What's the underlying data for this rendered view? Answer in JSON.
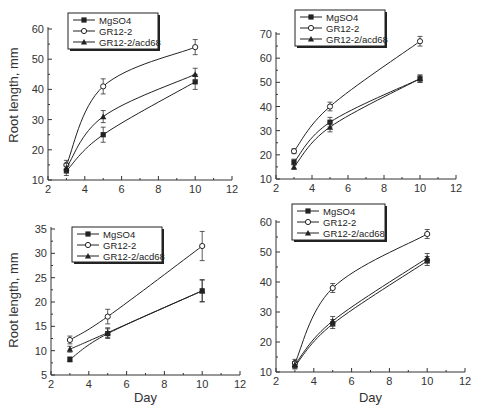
{
  "chart_data": [
    {
      "type": "line",
      "panel": "top-left",
      "title": "",
      "xlabel": "",
      "ylabel": "Root length, mm",
      "xlim": [
        2,
        12
      ],
      "ylim": [
        10,
        60
      ],
      "xticks": [
        2,
        4,
        6,
        8,
        10,
        12
      ],
      "yticks": [
        10,
        20,
        30,
        40,
        50,
        60
      ],
      "legend_position": "top-left inside",
      "grid": false,
      "x": [
        3,
        5,
        10
      ],
      "series": [
        {
          "name": "MgSO4",
          "marker": "filled-square",
          "values": [
            13,
            25,
            42.5
          ],
          "errors": [
            1.5,
            2.5,
            2.5
          ]
        },
        {
          "name": "GR12-2",
          "marker": "open-circle",
          "values": [
            15,
            41,
            54
          ],
          "errors": [
            1.5,
            2.5,
            2.5
          ]
        },
        {
          "name": "GR12-2/acd68",
          "marker": "filled-triangle",
          "values": [
            14,
            31,
            45
          ],
          "errors": [
            1.5,
            2,
            2
          ]
        }
      ]
    },
    {
      "type": "line",
      "panel": "top-right",
      "title": "",
      "xlabel": "",
      "ylabel": "",
      "xlim": [
        2,
        12
      ],
      "ylim": [
        10,
        70
      ],
      "xticks": [
        2,
        4,
        6,
        8,
        10,
        12
      ],
      "yticks": [
        10,
        20,
        30,
        40,
        50,
        60,
        70
      ],
      "legend_position": "top inside",
      "grid": false,
      "x": [
        3,
        5,
        10
      ],
      "series": [
        {
          "name": "MgSO4",
          "marker": "filled-square",
          "values": [
            17,
            33.5,
            51.5
          ],
          "errors": [
            1.2,
            2,
            1.5
          ]
        },
        {
          "name": "GR12-2",
          "marker": "open-circle",
          "values": [
            21.5,
            40,
            67
          ],
          "errors": [
            1,
            1.8,
            2
          ]
        },
        {
          "name": "GR12-2/acd68",
          "marker": "filled-triangle",
          "values": [
            15,
            31.5,
            51.5
          ],
          "errors": [
            1,
            2,
            1.5
          ]
        }
      ]
    },
    {
      "type": "line",
      "panel": "bottom-left",
      "title": "",
      "xlabel": "Day",
      "ylabel": "Root length, mm",
      "xlim": [
        2,
        12
      ],
      "ylim": [
        5,
        35
      ],
      "xticks": [
        2,
        4,
        6,
        8,
        10,
        12
      ],
      "yticks": [
        5,
        10,
        15,
        20,
        25,
        30,
        35
      ],
      "legend_position": "top-left inside",
      "grid": false,
      "x": [
        3,
        5,
        10
      ],
      "series": [
        {
          "name": "MgSO4",
          "marker": "filled-square",
          "values": [
            8.2,
            13.5,
            22.3
          ],
          "errors": [
            0.5,
            1,
            2.2
          ]
        },
        {
          "name": "GR12-2",
          "marker": "open-circle",
          "values": [
            12.2,
            17,
            31.5
          ],
          "errors": [
            0.8,
            1.5,
            3
          ]
        },
        {
          "name": "GR12-2/acd68",
          "marker": "filled-triangle",
          "values": [
            10.3,
            13.7,
            22.3
          ],
          "errors": [
            0.6,
            1,
            2.3
          ]
        }
      ]
    },
    {
      "type": "line",
      "panel": "bottom-right",
      "title": "",
      "xlabel": "Day",
      "ylabel": "",
      "xlim": [
        2,
        12
      ],
      "ylim": [
        10,
        60
      ],
      "xticks": [
        2,
        4,
        6,
        8,
        10,
        12
      ],
      "yticks": [
        10,
        20,
        30,
        40,
        50,
        60
      ],
      "legend_position": "top inside",
      "grid": false,
      "x": [
        3,
        5,
        10
      ],
      "series": [
        {
          "name": "MgSO4",
          "marker": "filled-square",
          "values": [
            12,
            26,
            47
          ],
          "errors": [
            1,
            1.5,
            1.5
          ]
        },
        {
          "name": "GR12-2",
          "marker": "open-circle",
          "values": [
            13,
            38,
            56
          ],
          "errors": [
            1.2,
            1.5,
            1.5
          ]
        },
        {
          "name": "GR12-2/acd68",
          "marker": "filled-triangle",
          "values": [
            12.5,
            27,
            48
          ],
          "errors": [
            1,
            1.5,
            1.5
          ]
        }
      ]
    }
  ],
  "layout": [
    {
      "x0": 48,
      "x1": 232,
      "y0": 180,
      "y1": 29,
      "legend": {
        "x": 68,
        "y": 13,
        "w": 90,
        "h": 36
      },
      "ylabel_x": 18,
      "ylabel_y": 95,
      "xlabel_y": null
    },
    {
      "x0": 276,
      "x1": 456,
      "y0": 179,
      "y1": 34,
      "legend": {
        "x": 295,
        "y": 10,
        "w": 90,
        "h": 36
      },
      "ylabel_x": null,
      "xlabel_y": null
    },
    {
      "x0": 51,
      "x1": 240,
      "y0": 375,
      "y1": 229,
      "legend": {
        "x": 72,
        "y": 227,
        "w": 90,
        "h": 35
      },
      "ylabel_x": 18,
      "ylabel_y": 300,
      "xlabel_y": 402
    },
    {
      "x0": 276,
      "x1": 465,
      "y0": 372,
      "y1": 222,
      "legend": {
        "x": 292,
        "y": 204,
        "w": 93,
        "h": 36
      },
      "ylabel_x": null,
      "xlabel_y": 402
    }
  ]
}
